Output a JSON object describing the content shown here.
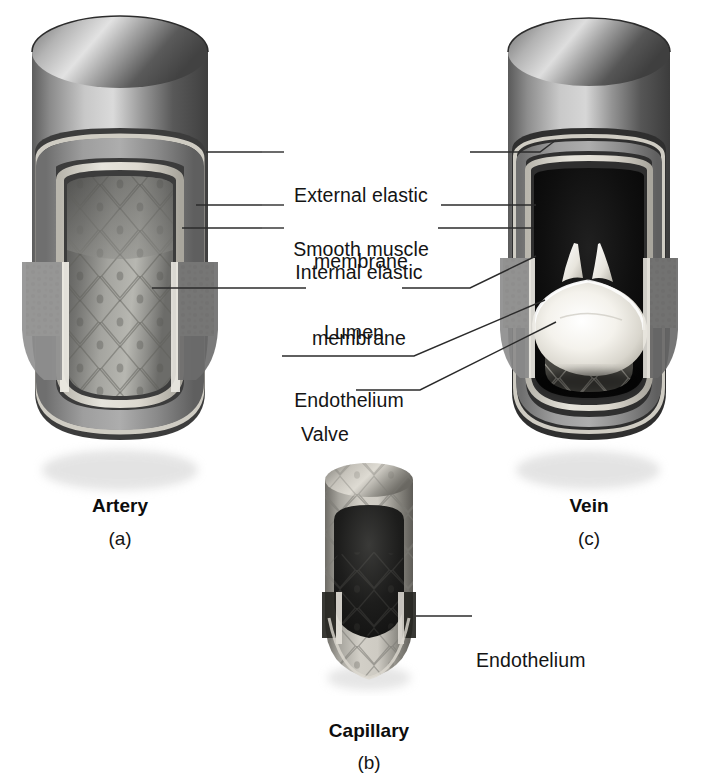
{
  "figure": {
    "title_implicit": "Comparison of blood vessel wall structure",
    "background_color": "#ffffff",
    "leader_line_color": "#2b2b2b",
    "text_color": "#141414"
  },
  "labels": {
    "external_elastic_membrane": {
      "line1": "External elastic",
      "line2": "membrane"
    },
    "smooth_muscle": {
      "line1": "Smooth muscle"
    },
    "internal_elastic_membrane": {
      "line1": "Internal elastic",
      "line2": "membrane"
    },
    "lumen": {
      "line1": "Lumen"
    },
    "endothelium": {
      "line1": "Endothelium"
    },
    "valve": {
      "line1": "Valve"
    },
    "capillary_endothelium": {
      "line1": "Endothelium"
    }
  },
  "vessels": [
    {
      "id": "artery",
      "name": "Artery",
      "panel_letter": "(a)",
      "wall_colors": {
        "outer_tunica": "#6b6b6b",
        "smooth_muscle": "#8d8d8d",
        "elastic_membrane": "#d8d6cf",
        "lumen_wall": "#9a9a96",
        "lumen_interior": "#6f6f6c",
        "cut_stipple": "#cfcdc4"
      },
      "features": [
        "thick wall",
        "external elastic membrane",
        "smooth muscle",
        "internal elastic membrane",
        "lumen",
        "endothelium"
      ]
    },
    {
      "id": "capillary",
      "name": "Capillary",
      "panel_letter": "(b)",
      "wall_colors": {
        "tube": "#b9b7b0",
        "interior": "#2b2b2b",
        "endothelium_band": "#cfcdc6"
      },
      "features": [
        "single endothelium layer"
      ]
    },
    {
      "id": "vein",
      "name": "Vein",
      "panel_letter": "(c)",
      "wall_colors": {
        "outer_tunica": "#6b6b6b",
        "smooth_muscle": "#8d8d8d",
        "elastic_membrane": "#d8d6cf",
        "lumen_interior": "#0e0e0e",
        "valve": "#f2f0ea",
        "cut_stipple": "#cfcdc4"
      },
      "features": [
        "thin wall",
        "large dark lumen",
        "valve cusps",
        "endothelium"
      ]
    }
  ],
  "leader_lines": {
    "external_elastic_membrane": {
      "to_artery": true,
      "to_vein": true
    },
    "smooth_muscle": {
      "to_artery": true,
      "to_vein": true
    },
    "internal_elastic_membrane": {
      "to_artery": true,
      "to_vein": true
    },
    "lumen": {
      "to_artery": true,
      "to_vein": true
    },
    "endothelium": {
      "to_vein": true
    },
    "valve": {
      "to_vein": true
    },
    "capillary_endothelium": {
      "to_capillary": true
    }
  }
}
